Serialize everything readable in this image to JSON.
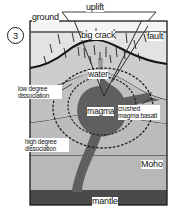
{
  "figure": {
    "panel_number": "3",
    "type": "geologic cross-section",
    "labels": {
      "uplift": "uplift",
      "ground": "ground",
      "big_crack": "big crack",
      "fault": "fault",
      "water": "water",
      "magma": "magma",
      "crushed_magma_basalt": "crushed magma basalt",
      "low_degree_dissociation": "low degree dissociation",
      "high_degree_dissociation": "high degree dissociation",
      "moho": "Moho",
      "mantle": "mantle"
    },
    "colors": {
      "crust_upper": "#cfcfcf",
      "crust_lower": "#bdbdbd",
      "magma": "#6b6b6b",
      "mantle": "#4a4a4a",
      "sky": "#f2f2f2",
      "line": "#1a1a1a",
      "label_bg": "#ffffff"
    }
  }
}
